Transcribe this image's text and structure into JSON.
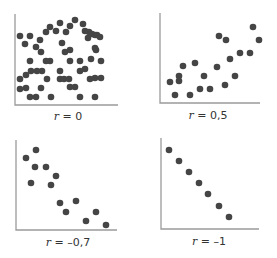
{
  "figure": {
    "dot_color": "#454545",
    "axis_color": "#9a9a9a"
  },
  "panels": [
    {
      "id": "r0",
      "label_var": "r",
      "label_eq": " = 0",
      "axis": {
        "x0": 15,
        "y0": 105,
        "xmax": 118,
        "ytop": 14
      },
      "label_pos": {
        "x": 68,
        "y": 110
      }
    },
    {
      "id": "r05",
      "label_var": "r",
      "label_eq": " = 0,5",
      "axis": {
        "x0": 160,
        "y0": 103,
        "xmax": 260,
        "ytop": 13
      },
      "label_pos": {
        "x": 208,
        "y": 109
      }
    },
    {
      "id": "rneg07",
      "label_var": "r",
      "label_eq": " = –0,7",
      "axis": {
        "x0": 16,
        "y0": 230,
        "xmax": 117,
        "ytop": 140
      },
      "label_pos": {
        "x": 68,
        "y": 236
      }
    },
    {
      "id": "rneg1",
      "label_var": "r",
      "label_eq": " = –1",
      "axis": {
        "x0": 161,
        "y0": 229,
        "xmax": 259,
        "ytop": 138
      },
      "label_pos": {
        "x": 209,
        "y": 235
      }
    }
  ],
  "chart_data": [
    {
      "type": "scatter",
      "title": "r = 0",
      "xlabel": "",
      "ylabel": "",
      "grid": false,
      "points": [
        [
          20,
          36
        ],
        [
          30,
          36
        ],
        [
          25,
          44
        ],
        [
          36,
          47
        ],
        [
          40,
          40
        ],
        [
          46,
          32
        ],
        [
          50,
          27
        ],
        [
          56,
          31
        ],
        [
          60,
          23
        ],
        [
          66,
          32
        ],
        [
          70,
          26
        ],
        [
          75,
          20
        ],
        [
          83,
          24
        ],
        [
          85,
          31
        ],
        [
          88,
          38
        ],
        [
          89,
          32
        ],
        [
          92,
          34
        ],
        [
          95,
          35
        ],
        [
          97,
          35
        ],
        [
          100,
          37
        ],
        [
          96,
          50
        ],
        [
          95,
          48
        ],
        [
          91,
          59
        ],
        [
          62,
          43
        ],
        [
          41,
          52
        ],
        [
          65,
          52
        ],
        [
          70,
          50
        ],
        [
          30,
          61
        ],
        [
          50,
          61
        ],
        [
          46,
          61
        ],
        [
          70,
          61
        ],
        [
          80,
          61
        ],
        [
          85,
          69
        ],
        [
          101,
          61
        ],
        [
          31,
          71
        ],
        [
          42,
          71
        ],
        [
          37,
          71
        ],
        [
          60,
          71
        ],
        [
          80,
          71
        ],
        [
          95,
          78
        ],
        [
          20,
          79
        ],
        [
          26,
          75
        ],
        [
          47,
          79
        ],
        [
          60,
          79
        ],
        [
          64,
          79
        ],
        [
          69,
          79
        ],
        [
          90,
          79
        ],
        [
          101,
          78
        ],
        [
          20,
          89
        ],
        [
          26,
          88
        ],
        [
          41,
          88
        ],
        [
          70,
          87
        ],
        [
          75,
          87
        ],
        [
          30,
          97
        ],
        [
          36,
          97
        ],
        [
          51,
          97
        ],
        [
          80,
          97
        ],
        [
          95,
          97
        ]
      ]
    },
    {
      "type": "scatter",
      "title": "r = 0,5",
      "xlabel": "",
      "ylabel": "",
      "grid": false,
      "points": [
        [
          253,
          27
        ],
        [
          219,
          36
        ],
        [
          226,
          40
        ],
        [
          259,
          40
        ],
        [
          240,
          53
        ],
        [
          250,
          53
        ],
        [
          230,
          59
        ],
        [
          183,
          66
        ],
        [
          195,
          63
        ],
        [
          217,
          67
        ],
        [
          204,
          76
        ],
        [
          235,
          76
        ],
        [
          179,
          76
        ],
        [
          170,
          82
        ],
        [
          179,
          81
        ],
        [
          225,
          85
        ],
        [
          200,
          89
        ],
        [
          210,
          89
        ],
        [
          175,
          95
        ],
        [
          190,
          95
        ]
      ]
    },
    {
      "type": "scatter",
      "title": "r = –0,7",
      "xlabel": "",
      "ylabel": "",
      "grid": false,
      "points": [
        [
          36,
          150
        ],
        [
          26,
          158
        ],
        [
          35,
          167
        ],
        [
          46,
          167
        ],
        [
          56,
          176
        ],
        [
          31,
          183
        ],
        [
          51,
          185
        ],
        [
          60,
          203
        ],
        [
          76,
          201
        ],
        [
          66,
          212
        ],
        [
          96,
          212
        ],
        [
          86,
          221
        ],
        [
          106,
          225
        ]
      ]
    },
    {
      "type": "scatter",
      "title": "r = –1",
      "xlabel": "",
      "ylabel": "",
      "grid": false,
      "points": [
        [
          169,
          150
        ],
        [
          179,
          161
        ],
        [
          189,
          172
        ],
        [
          199,
          183
        ],
        [
          208,
          194
        ],
        [
          219,
          206
        ],
        [
          229,
          217
        ]
      ]
    }
  ]
}
